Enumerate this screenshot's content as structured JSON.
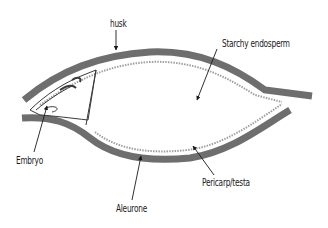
{
  "diagram": {
    "labels": {
      "husk": "husk",
      "starchy_endosperm": "Starchy endosperm",
      "embryo": "Embryo",
      "aleurone": "Aleurone",
      "pericarp_testa": "Pericarp/testa"
    },
    "colors": {
      "husk_band": "#6e6e6e",
      "aleurone_dots": "#9a9a9a",
      "line": "#2a2a2a",
      "background": "#ffffff"
    }
  }
}
